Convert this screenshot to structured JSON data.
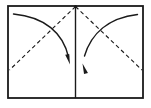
{
  "diagram": {
    "type": "origami-fold-step",
    "background_color": "#ffffff",
    "ink_color": "#1a1a1a",
    "stroke_widths": {
      "outline": 1.8,
      "center_line": 1.4,
      "dashed_crease": 1.1,
      "arrow": 1.4
    },
    "dash_pattern": "4 3",
    "sheet": {
      "label": "paper-sheet",
      "x": 8,
      "y": 6,
      "width": 135,
      "height": 92
    },
    "center_line": {
      "label": "vertical-center-crease",
      "x": 75.5,
      "y_top": 6,
      "y_bottom": 98
    },
    "apex_point": {
      "label": "top-center-apex",
      "x": 75.5,
      "y": 6.5
    },
    "creases": [
      {
        "name": "left-diagonal-crease",
        "style": "dashed",
        "from_x": 75.5,
        "from_y": 6.5,
        "to_x": 9.5,
        "to_y": 70.0
      },
      {
        "name": "right-diagonal-crease",
        "style": "dashed",
        "from_x": 75.5,
        "from_y": 6.5,
        "to_x": 142.0,
        "to_y": 70.0
      }
    ],
    "arrows": [
      {
        "name": "left-fold-arrow",
        "direction": "fold-left-corner-down-right",
        "start_x": 13.5,
        "start_y": 14.0,
        "ctrl1_x": 45.0,
        "ctrl1_y": 17.0,
        "ctrl2_x": 63.0,
        "ctrl2_y": 33.0,
        "end_x": 68.5,
        "end_y": 57.0,
        "head_tip_x": 70.0,
        "head_tip_y": 64.5,
        "head_angle_deg": 80
      },
      {
        "name": "right-fold-arrow",
        "direction": "fold-right-corner-down-left",
        "start_x": 137.5,
        "start_y": 14.5,
        "ctrl1_x": 108.0,
        "ctrl1_y": 18.0,
        "ctrl2_x": 91.0,
        "ctrl2_y": 34.0,
        "end_x": 84.5,
        "end_y": 56.0,
        "head_tip_x": 82.5,
        "head_tip_y": 63.5,
        "head_angle_deg": 256
      }
    ]
  }
}
